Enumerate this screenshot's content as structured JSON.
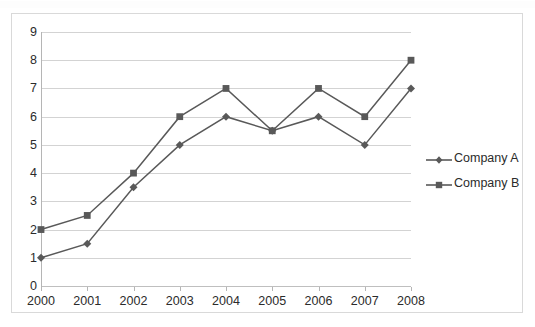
{
  "chart_data": {
    "type": "line",
    "title": "",
    "xlabel": "",
    "ylabel": "",
    "categories": [
      "2000",
      "2001",
      "2002",
      "2003",
      "2004",
      "2005",
      "2006",
      "2007",
      "2008"
    ],
    "x": [
      2000,
      2001,
      2002,
      2003,
      2004,
      2005,
      2006,
      2007,
      2008
    ],
    "series": [
      {
        "name": "Company A",
        "marker": "diamond",
        "color": "#595959",
        "values": [
          1,
          1.5,
          3.5,
          5,
          6,
          5.5,
          6,
          5,
          7
        ]
      },
      {
        "name": "Company B",
        "marker": "square",
        "color": "#595959",
        "values": [
          2,
          2.5,
          4,
          6,
          7,
          5.5,
          7,
          6,
          8
        ]
      }
    ],
    "ylim": [
      0,
      9
    ],
    "y_ticks": [
      0,
      1,
      2,
      3,
      4,
      5,
      6,
      7,
      8,
      9
    ],
    "y_tick_labels": [
      "0",
      "1",
      "2",
      "3",
      "4",
      "5",
      "6",
      "7",
      "8",
      "9"
    ],
    "grid": true,
    "grid_axis": "y",
    "legend_position": "right",
    "colors": {
      "line": "#595959",
      "gridline": "#d3d3d3",
      "axis": "#b5b5b5",
      "frame": "#d9d9d9",
      "text": "#2b2b2b",
      "background": "#ffffff"
    }
  },
  "legend": {
    "entries": [
      {
        "label": "Company A",
        "marker": "diamond"
      },
      {
        "label": "Company B",
        "marker": "square"
      }
    ]
  }
}
